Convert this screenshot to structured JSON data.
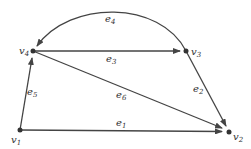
{
  "diagram": {
    "type": "directed-graph",
    "colors": {
      "edge": "#444444",
      "node": "#333333",
      "background": "#ffffff"
    },
    "nodes": [
      {
        "id": "v1",
        "base": "v",
        "sub": "1",
        "x": 20,
        "y": 130
      },
      {
        "id": "v2",
        "base": "v",
        "sub": "2",
        "x": 229,
        "y": 132
      },
      {
        "id": "v3",
        "base": "v",
        "sub": "3",
        "x": 186,
        "y": 51
      },
      {
        "id": "v4",
        "base": "v",
        "sub": "4",
        "x": 33,
        "y": 51
      }
    ],
    "edges": [
      {
        "id": "e1",
        "base": "e",
        "sub": "1",
        "from": "v1",
        "to": "v2"
      },
      {
        "id": "e2",
        "base": "e",
        "sub": "2",
        "from": "v3",
        "to": "v2"
      },
      {
        "id": "e3",
        "base": "e",
        "sub": "3",
        "from": "v4",
        "to": "v3"
      },
      {
        "id": "e4",
        "base": "e",
        "sub": "4",
        "from": "v3",
        "to": "v4",
        "curved": true
      },
      {
        "id": "e5",
        "base": "e",
        "sub": "5",
        "from": "v1",
        "to": "v4"
      },
      {
        "id": "e6",
        "base": "e",
        "sub": "6",
        "from": "v4",
        "to": "v2"
      }
    ]
  }
}
